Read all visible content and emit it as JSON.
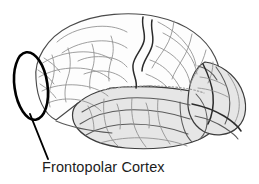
{
  "figure": {
    "domain_type": "diagram",
    "title": "Frontopolar Cortex",
    "background_color": "#ffffff",
    "width": 259,
    "height": 184
  },
  "annotation": {
    "label": "Frontopolar Cortex",
    "label_color": "#1c1c1c",
    "highlight_shape": "ellipse",
    "highlight_color": "#000000",
    "leader_line_color": "#000000"
  },
  "anatomy": {
    "view": "lateral",
    "regions": [
      {
        "name": "frontal-lobe",
        "shading": "white",
        "fill": "#fdfdfd"
      },
      {
        "name": "parietal-lobe",
        "shading": "white",
        "fill": "#fdfdfd"
      },
      {
        "name": "temporal-lobe",
        "shading": "light-gray",
        "fill": "#e6e6e6"
      },
      {
        "name": "occipital-lobe",
        "shading": "light-gray",
        "fill": "#e6e6e6"
      }
    ],
    "landmarks": [
      {
        "name": "central-sulcus",
        "style": "dark-solid",
        "color": "#2b2b2b"
      },
      {
        "name": "sylvian-fissure",
        "style": "dotted",
        "color": "#9a9a9a"
      },
      {
        "name": "frontal-pole",
        "style": "highlighted"
      }
    ]
  }
}
